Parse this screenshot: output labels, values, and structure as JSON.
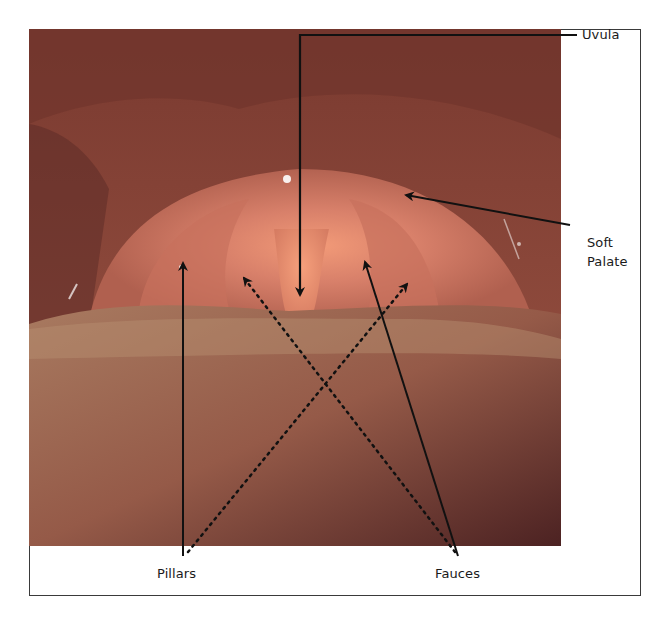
{
  "figure": {
    "type": "annotated-anatomical-photo",
    "colors": {
      "frame_border": "#3a3a3a",
      "background": "#ffffff",
      "arrow": "#111111",
      "tissue_dark": "#5a2a24",
      "tissue_mid": "#9a5040",
      "tissue_light": "#e0876a",
      "tongue": "#9a6a55"
    }
  },
  "labels": {
    "uvula": "Uvula",
    "soft_palate_line1": "Soft",
    "soft_palate_line2": "Palate",
    "pillars": "Pillars",
    "fauces": "Fauces"
  },
  "arrows": [
    {
      "label": "Uvula",
      "style": "solid",
      "points": [
        [
          575,
          35
        ],
        [
          300,
          35
        ],
        [
          300,
          290
        ]
      ]
    },
    {
      "label": "Soft Palate",
      "style": "solid",
      "points": [
        [
          568,
          225
        ],
        [
          407,
          195
        ]
      ]
    },
    {
      "label": "Pillars",
      "style": "solid",
      "points": [
        [
          183,
          550
        ],
        [
          183,
          263
        ]
      ]
    },
    {
      "label": "Pillars",
      "style": "dotted",
      "points": [
        [
          190,
          550
        ],
        [
          407,
          285
        ]
      ]
    },
    {
      "label": "Fauces",
      "style": "solid",
      "points": [
        [
          458,
          550
        ],
        [
          365,
          263
        ]
      ]
    },
    {
      "label": "Fauces",
      "style": "dotted",
      "points": [
        [
          455,
          550
        ],
        [
          245,
          278
        ]
      ]
    }
  ]
}
